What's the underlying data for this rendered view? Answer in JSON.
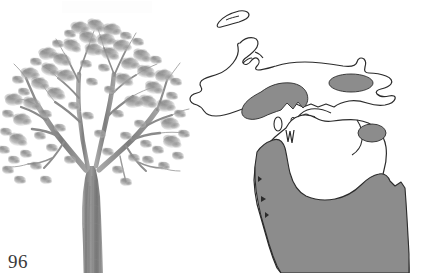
{
  "page": {
    "page_number": "96",
    "background_color": "#ffffff",
    "width": 424,
    "height": 273
  },
  "tree_figure": {
    "name": "tree-illustration",
    "subject": "deciduous broadleaf tree",
    "rendering": "grayscale pencil drawing",
    "foliage_color": "#9a9a9a",
    "foliage_shadow_color": "#6f6f6f",
    "trunk_color": "#8a8a8a",
    "trunk_outline_color": "#5d5d5d",
    "description": "Full-crown deciduous tree with broad spreading canopy, forked trunk, cropped at bottom edge"
  },
  "map_figure": {
    "name": "michigan-range-map",
    "state": "Michigan",
    "outline_color": "#2b2b2b",
    "shaded_range_color": "#8c8c8c",
    "unshaded_color": "#ffffff",
    "legend_meaning": "shaded areas indicate species distribution range",
    "regions": [
      {
        "name": "isle-royale",
        "shaded": false
      },
      {
        "name": "upper-peninsula",
        "shaded": false
      },
      {
        "name": "upper-peninsula-lake-michigan-shore-patch",
        "shaded": true
      },
      {
        "name": "eastern-upper-peninsula-patch",
        "shaded": true
      },
      {
        "name": "northeast-lower-peninsula-patch",
        "shaded": true
      },
      {
        "name": "southern-lower-peninsula",
        "shaded": true
      }
    ]
  }
}
